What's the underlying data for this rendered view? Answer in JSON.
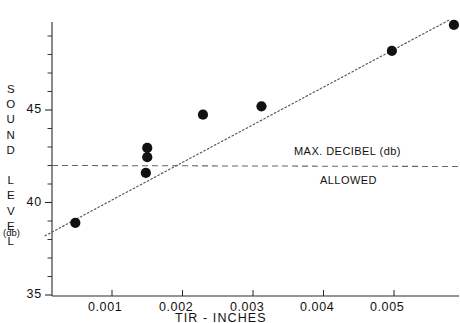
{
  "figure": {
    "background": "#ffffff",
    "ink_color": "#111111",
    "marker_color": "#111111",
    "trend_color": "#555555",
    "limit_color": "#666666"
  },
  "axis_titles": {
    "y_letters": "S\nO\nU\nN\nD\n\nL\nE\nV\nE\nL",
    "y_unit": "(db)",
    "x": "TIR  -  INCHES"
  },
  "annotations": {
    "limit_upper": "MAX. DECIBEL (db)",
    "limit_lower": "ALLOWED"
  },
  "chart_data": {
    "type": "scatter",
    "title": "",
    "xlabel": "TIR - INCHES",
    "ylabel": "SOUND LEVEL (db)",
    "xlim": [
      0.0,
      0.0059
    ],
    "ylim": [
      35,
      49.8
    ],
    "grid": false,
    "legend": false,
    "x_ticks": [
      0.001,
      0.002,
      0.003,
      0.004,
      0.005
    ],
    "x_tick_labels": [
      "0.001",
      "0.002",
      "0.003",
      "0.004",
      "0.005"
    ],
    "y_major_ticks": [
      35,
      40,
      45
    ],
    "y_major_tick_labels": [
      "35",
      "40",
      "45"
    ],
    "y_minor_tick_step": 1,
    "points": [
      {
        "x": 0.00048,
        "y": 38.9
      },
      {
        "x": 0.0015,
        "y": 42.95
      },
      {
        "x": 0.0015,
        "y": 42.45
      },
      {
        "x": 0.00148,
        "y": 41.6
      },
      {
        "x": 0.00229,
        "y": 44.75
      },
      {
        "x": 0.00312,
        "y": 45.2
      },
      {
        "x": 0.00497,
        "y": 48.2
      },
      {
        "x": 0.00585,
        "y": 49.6
      }
    ],
    "trend_line": {
      "style": "dotted",
      "x0": 5e-05,
      "y0": 38.2,
      "x1": 0.0058,
      "y1": 49.9
    },
    "limit_line": {
      "style": "dashed",
      "value": 42.0,
      "label_above": "MAX. DECIBEL (db)",
      "label_below": "ALLOWED"
    }
  }
}
